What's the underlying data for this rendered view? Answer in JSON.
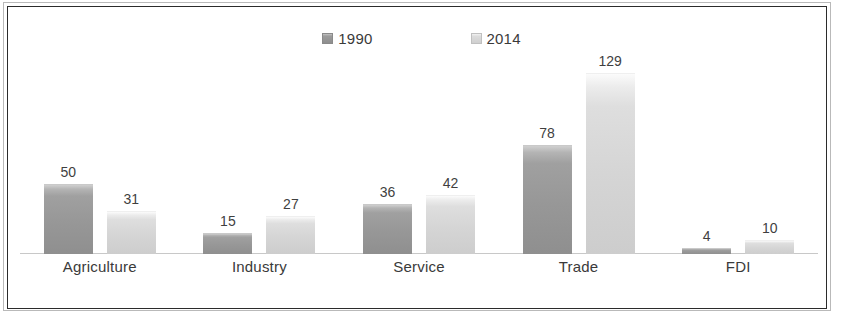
{
  "chart_data": {
    "type": "bar",
    "title": "",
    "subtitle": "",
    "xlabel": "",
    "ylabel": "",
    "categories": [
      "Agriculture",
      "Industry",
      "Service",
      "Trade",
      "FDI"
    ],
    "series": [
      {
        "name": "1990",
        "values": [
          50,
          15,
          36,
          78,
          4
        ],
        "color": "#9a9a9a"
      },
      {
        "name": "2014",
        "values": [
          31,
          27,
          42,
          129,
          10
        ],
        "color": "#d6d6d6"
      }
    ],
    "ylim": [
      0,
      140
    ],
    "grid": false,
    "legend_position": "top-center",
    "data_labels": true,
    "axis_line_color": "#c8c8c8",
    "frame_color": "#2b2b2b",
    "text_color": "#3a3a3a"
  },
  "legend": {
    "entries": [
      {
        "label": "1990",
        "swatch": "series-1990-swatch"
      },
      {
        "label": "2014",
        "swatch": "series-2014-swatch"
      }
    ]
  },
  "groups": [
    {
      "category": "Agriculture",
      "bars": [
        {
          "series": "1990",
          "value": 50,
          "label": "50"
        },
        {
          "series": "2014",
          "value": 31,
          "label": "31"
        }
      ]
    },
    {
      "category": "Industry",
      "bars": [
        {
          "series": "1990",
          "value": 15,
          "label": "15"
        },
        {
          "series": "2014",
          "value": 27,
          "label": "27"
        }
      ]
    },
    {
      "category": "Service",
      "bars": [
        {
          "series": "1990",
          "value": 36,
          "label": "36"
        },
        {
          "series": "2014",
          "value": 42,
          "label": "42"
        }
      ]
    },
    {
      "category": "Trade",
      "bars": [
        {
          "series": "1990",
          "value": 78,
          "label": "78"
        },
        {
          "series": "2014",
          "value": 129,
          "label": "129"
        }
      ]
    },
    {
      "category": "FDI",
      "bars": [
        {
          "series": "1990",
          "value": 4,
          "label": "4"
        },
        {
          "series": "2014",
          "value": 10,
          "label": "10"
        }
      ]
    }
  ]
}
